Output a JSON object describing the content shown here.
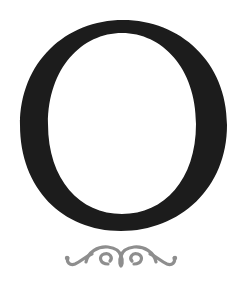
{
  "drop_cap": {
    "letter": "O",
    "fill_color": "#1c1c1c",
    "ornament_color": "#8e8e8e",
    "background": "#ffffff"
  },
  "ornament": {
    "icon": "scroll-flourish-icon"
  }
}
